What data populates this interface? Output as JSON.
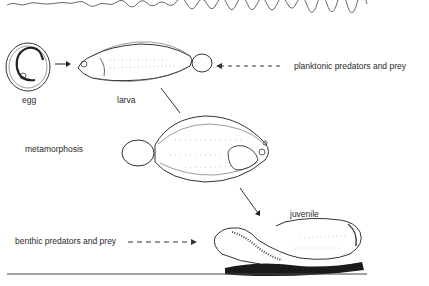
{
  "stages": {
    "egg": "egg",
    "larva": "larva",
    "metamorphosis": "metamorphosis",
    "juvenile": "juvenile"
  },
  "annotations": {
    "planktonic": "planktonic predators and prey",
    "benthic": "benthic predators and prey"
  },
  "colors": {
    "line": "#3a3a3a",
    "water_surface": "#6a6a6a",
    "sediment": "#1a1a1a"
  }
}
